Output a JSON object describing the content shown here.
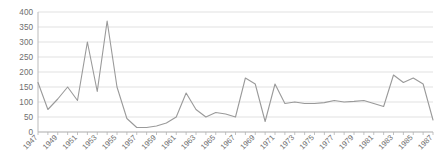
{
  "chart_data": {
    "type": "line",
    "title": "",
    "subtitle": "",
    "xlabel": "",
    "ylabel": "",
    "xlim": [
      1947,
      1987
    ],
    "ylim": [
      0,
      400
    ],
    "ytick_step": 50,
    "ytick_labels": [
      "0",
      "50",
      "100",
      "150",
      "200",
      "250",
      "300",
      "350",
      "400"
    ],
    "xtick_labels": [
      "1947",
      "1949",
      "1951",
      "1953",
      "1955",
      "1957",
      "1959",
      "1961",
      "1963",
      "1965",
      "1967",
      "1969",
      "1971",
      "1973",
      "1975",
      "1977",
      "1979",
      "1981",
      "1983",
      "1985",
      "1987"
    ],
    "xtick_step": 2,
    "grid": true,
    "grid_axis": "y",
    "legend": false,
    "legend_position": "none",
    "line_color": "#9a9a9a",
    "grid_color": "#d9d9d9",
    "axis_color": "#b3b3b3",
    "text_color": "#6e6e6e",
    "x": [
      1947,
      1948,
      1949,
      1950,
      1951,
      1952,
      1953,
      1954,
      1955,
      1956,
      1957,
      1958,
      1959,
      1960,
      1961,
      1962,
      1963,
      1964,
      1965,
      1966,
      1967,
      1968,
      1969,
      1970,
      1971,
      1972,
      1973,
      1974,
      1975,
      1976,
      1977,
      1978,
      1979,
      1980,
      1981,
      1982,
      1983,
      1984,
      1985,
      1986,
      1987
    ],
    "values": [
      165,
      75,
      110,
      150,
      105,
      300,
      135,
      370,
      150,
      45,
      15,
      15,
      20,
      30,
      50,
      130,
      75,
      50,
      65,
      60,
      50,
      180,
      160,
      35,
      160,
      95,
      100,
      95,
      95,
      98,
      105,
      100,
      102,
      105,
      95,
      85,
      190,
      165,
      180,
      160,
      40
    ],
    "series": [
      {
        "name": "Series 1",
        "values": [
          165,
          75,
          110,
          150,
          105,
          300,
          135,
          370,
          150,
          45,
          15,
          15,
          20,
          30,
          50,
          130,
          75,
          50,
          65,
          60,
          50,
          180,
          160,
          35,
          160,
          95,
          100,
          95,
          95,
          98,
          105,
          100,
          102,
          105,
          95,
          85,
          190,
          165,
          180,
          160,
          40
        ]
      }
    ]
  }
}
